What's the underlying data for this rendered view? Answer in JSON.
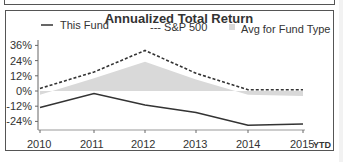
{
  "chart_data": {
    "type": "line",
    "title": "Annualized Total Return",
    "xlabel": "",
    "ylabel": "",
    "categories": [
      "2010",
      "2011",
      "2012",
      "2013",
      "2014",
      "2015"
    ],
    "x_suffix_label": "YTD",
    "series": [
      {
        "name": "This Fund",
        "style": "solid",
        "color": "#333333",
        "values": [
          -13,
          -2,
          -11,
          -17,
          -27,
          -26
        ]
      },
      {
        "name": "S&P 500",
        "style": "dashed",
        "color": "#333333",
        "values": [
          2,
          15,
          32,
          14,
          1,
          1
        ]
      },
      {
        "name": "Avg for Fund Type",
        "style": "area",
        "color": "#d9d9d9",
        "values": [
          -3,
          10,
          23,
          9,
          -3,
          -4
        ]
      }
    ],
    "yticks": [
      "36%",
      "24%",
      "12%",
      "0%",
      "-12%",
      "-24%"
    ],
    "ylim": [
      -30,
      40
    ],
    "grid": false,
    "legend_position": "top"
  },
  "legend": {
    "fund": "This Fund",
    "sp": "--- S&P 500",
    "avg": "Avg for Fund Type"
  }
}
